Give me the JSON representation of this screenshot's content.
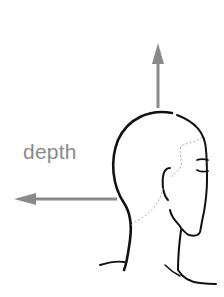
{
  "diagram": {
    "labels": {
      "depth": "depth"
    },
    "arrows": [
      {
        "name": "up-arrow",
        "direction": "up"
      },
      {
        "name": "depth-arrow",
        "direction": "left"
      }
    ],
    "colors": {
      "arrow": "#8a8a8a",
      "outline": "#111111",
      "dotted": "#aaaaaa",
      "label": "#8a8a8a"
    }
  }
}
